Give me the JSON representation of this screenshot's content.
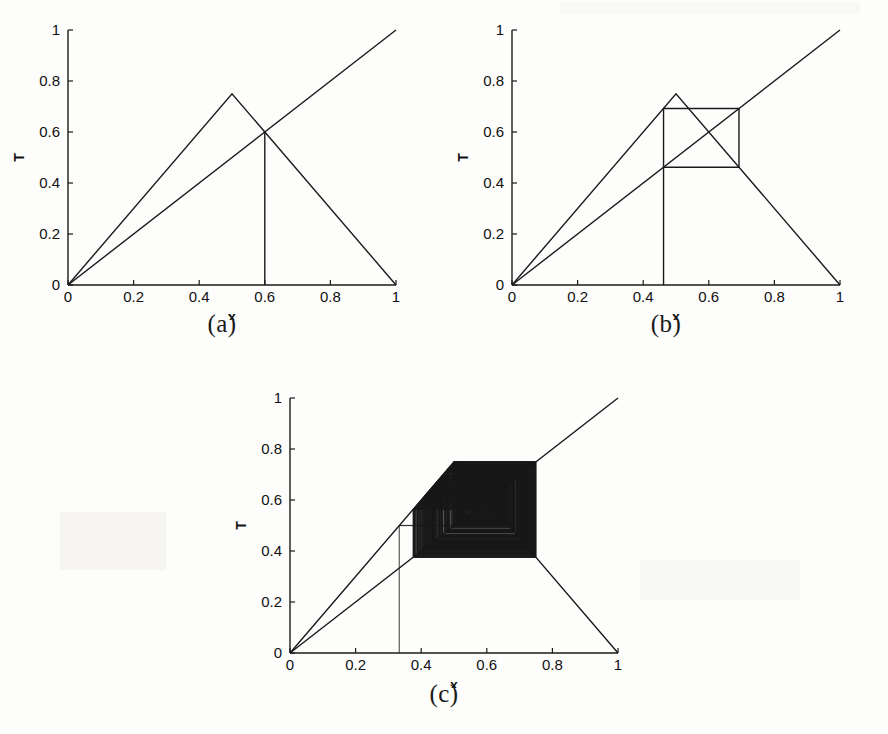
{
  "figure": {
    "background_color": "#fdfdfc",
    "line_color": "#1a1a1a",
    "panel_count": 3
  },
  "panels": [
    {
      "id": "a",
      "caption": "(a)",
      "xlabel": "x",
      "ylabel": "T",
      "xticks": [
        "0",
        "0.2",
        "0.4",
        "0.6",
        "0.8",
        "1"
      ],
      "xtick_values": [
        0,
        0.2,
        0.4,
        0.6,
        0.8,
        1
      ],
      "yticks": [
        "0",
        "0.2",
        "0.4",
        "0.6",
        "0.8",
        "1"
      ],
      "ytick_values": [
        0,
        0.2,
        0.4,
        0.6,
        0.8,
        1
      ],
      "xlim": [
        0,
        1
      ],
      "ylim": [
        0,
        1
      ]
    },
    {
      "id": "b",
      "caption": "(b)",
      "xlabel": "x",
      "ylabel": "T",
      "xticks": [
        "0",
        "0.2",
        "0.4",
        "0.6",
        "0.8",
        "1"
      ],
      "xtick_values": [
        0,
        0.2,
        0.4,
        0.6,
        0.8,
        1
      ],
      "yticks": [
        "0",
        "0.2",
        "0.4",
        "0.6",
        "0.8",
        "1"
      ],
      "ytick_values": [
        0,
        0.2,
        0.4,
        0.6,
        0.8,
        1
      ],
      "xlim": [
        0,
        1
      ],
      "ylim": [
        0,
        1
      ]
    },
    {
      "id": "c",
      "caption": "(c)",
      "xlabel": "x",
      "ylabel": "T",
      "xticks": [
        "0",
        "0.2",
        "0.4",
        "0.6",
        "0.8",
        "1"
      ],
      "xtick_values": [
        0,
        0.2,
        0.4,
        0.6,
        0.8,
        1
      ],
      "yticks": [
        "0",
        "0.2",
        "0.4",
        "0.6",
        "0.8",
        "1"
      ],
      "ytick_values": [
        0,
        0.2,
        0.4,
        0.6,
        0.8,
        1
      ],
      "xlim": [
        0,
        1
      ],
      "ylim": [
        0,
        1
      ]
    }
  ],
  "chart_data": [
    {
      "type": "line",
      "panel": "a",
      "title": "(a)",
      "xlabel": "x",
      "ylabel": "T",
      "xlim": [
        0,
        1
      ],
      "ylim": [
        0,
        1
      ],
      "grid": false,
      "legend": "none",
      "xticks": [
        0,
        0.2,
        0.4,
        0.6,
        0.8,
        1
      ],
      "yticks": [
        0,
        0.2,
        0.4,
        0.6,
        0.8,
        1
      ],
      "series": [
        {
          "name": "tent-map",
          "comment": "piecewise-linear tent map T(x), peak height 0.75 at x=0.5",
          "points": [
            [
              0,
              0
            ],
            [
              0.5,
              0.75
            ],
            [
              1,
              0
            ]
          ]
        },
        {
          "name": "identity-line",
          "comment": "y = x diagonal",
          "points": [
            [
              0,
              0
            ],
            [
              1,
              1
            ]
          ]
        },
        {
          "name": "cobweb-fixed-point",
          "comment": "vertical segment at the stable fixed point x*=0.6",
          "points": [
            [
              0.6,
              0
            ],
            [
              0.6,
              0.6
            ]
          ]
        }
      ],
      "annotations": [
        {
          "label": "peak",
          "x": 0.5,
          "y": 0.75
        },
        {
          "label": "fixed-point",
          "x": 0.6,
          "y": 0.6
        }
      ]
    },
    {
      "type": "line",
      "panel": "b",
      "title": "(b)",
      "xlabel": "x",
      "ylabel": "T",
      "xlim": [
        0,
        1
      ],
      "ylim": [
        0,
        1
      ],
      "grid": false,
      "legend": "none",
      "xticks": [
        0,
        0.2,
        0.4,
        0.6,
        0.8,
        1
      ],
      "yticks": [
        0,
        0.2,
        0.4,
        0.6,
        0.8,
        1
      ],
      "series": [
        {
          "name": "tent-map",
          "comment": "tent map with peak height 0.75 at x=0.5",
          "points": [
            [
              0,
              0
            ],
            [
              0.5,
              0.75
            ],
            [
              1,
              0
            ]
          ]
        },
        {
          "name": "identity-line",
          "points": [
            [
              0,
              0
            ],
            [
              1,
              1
            ]
          ]
        },
        {
          "name": "cobweb-period-2",
          "comment": "period-2 orbit: square box between x=0.462 and x=0.692 plus initial vertical",
          "points": [
            [
              0.462,
              0
            ],
            [
              0.462,
              0.692
            ],
            [
              0.692,
              0.692
            ],
            [
              0.692,
              0.462
            ],
            [
              0.462,
              0.462
            ],
            [
              0.462,
              0.692
            ]
          ]
        }
      ],
      "annotations": [
        {
          "label": "peak",
          "x": 0.5,
          "y": 0.75
        },
        {
          "label": "orbit-low",
          "x": 0.462,
          "y": 0.462
        },
        {
          "label": "orbit-high",
          "x": 0.692,
          "y": 0.692
        }
      ]
    },
    {
      "type": "line",
      "panel": "c",
      "title": "(c)",
      "xlabel": "x",
      "ylabel": "T",
      "xlim": [
        0,
        1
      ],
      "ylim": [
        0,
        1
      ],
      "grid": false,
      "legend": "none",
      "xticks": [
        0,
        0.2,
        0.4,
        0.6,
        0.8,
        1
      ],
      "yticks": [
        0,
        0.2,
        0.4,
        0.6,
        0.8,
        1
      ],
      "series": [
        {
          "name": "tent-map",
          "comment": "tent map with peak height 0.75 at x=0.5",
          "points": [
            [
              0,
              0
            ],
            [
              0.5,
              0.75
            ],
            [
              1,
              0
            ]
          ]
        },
        {
          "name": "identity-line",
          "points": [
            [
              0,
              0
            ],
            [
              1,
              1
            ]
          ]
        },
        {
          "name": "cobweb-chaotic-spiral",
          "comment": "dense outward cobweb spiral from x0=0.333 filling the square 0.375..0.75 x 0.375..0.75; rendered procedurally",
          "x0": 0.333,
          "iterations": 260,
          "peak": 0.75,
          "peak_x": 0.5
        }
      ],
      "annotations": [
        {
          "label": "initial-condition",
          "x": 0.333,
          "y": 0.5
        },
        {
          "label": "spiral-center",
          "x": 0.6,
          "y": 0.6
        }
      ]
    }
  ]
}
